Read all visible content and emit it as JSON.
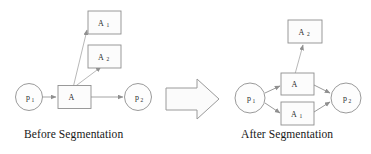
{
  "figure": {
    "title_left": "Before Segmentation",
    "title_right": "After Segmentation",
    "transition_icon": "right-block-arrow",
    "colors": {
      "stroke": "#8c8c8c",
      "node_fill": "#fdfdfd",
      "text": "#2a2a2a",
      "caption": "#171717",
      "background": "#ffffff"
    }
  },
  "diagram_before": {
    "nodes": [
      {
        "id": "p1",
        "label": "p",
        "subscript": "1",
        "shape": "circle"
      },
      {
        "id": "A",
        "label": "A",
        "subscript": "",
        "shape": "rect"
      },
      {
        "id": "p2",
        "label": "p",
        "subscript": "2",
        "shape": "circle"
      },
      {
        "id": "A1",
        "label": "A",
        "subscript": "1",
        "shape": "rect"
      },
      {
        "id": "A2",
        "label": "A",
        "subscript": "2",
        "shape": "rect"
      }
    ],
    "edges": [
      {
        "from": "p1",
        "to": "A"
      },
      {
        "from": "A",
        "to": "p2"
      },
      {
        "from": "A",
        "to": "A1"
      },
      {
        "from": "A",
        "to": "A2"
      }
    ]
  },
  "diagram_after": {
    "nodes": [
      {
        "id": "p1",
        "label": "p",
        "subscript": "1",
        "shape": "circle"
      },
      {
        "id": "A",
        "label": "A",
        "subscript": "",
        "shape": "rect"
      },
      {
        "id": "A1",
        "label": "A",
        "subscript": "1",
        "shape": "rect"
      },
      {
        "id": "A2",
        "label": "A",
        "subscript": "2",
        "shape": "rect"
      },
      {
        "id": "p2",
        "label": "p",
        "subscript": "2",
        "shape": "circle"
      }
    ],
    "edges": [
      {
        "from": "p1",
        "to": "A"
      },
      {
        "from": "p1",
        "to": "A1"
      },
      {
        "from": "A",
        "to": "p2"
      },
      {
        "from": "A1",
        "to": "p2"
      },
      {
        "from": "A",
        "to": "A2"
      }
    ]
  }
}
